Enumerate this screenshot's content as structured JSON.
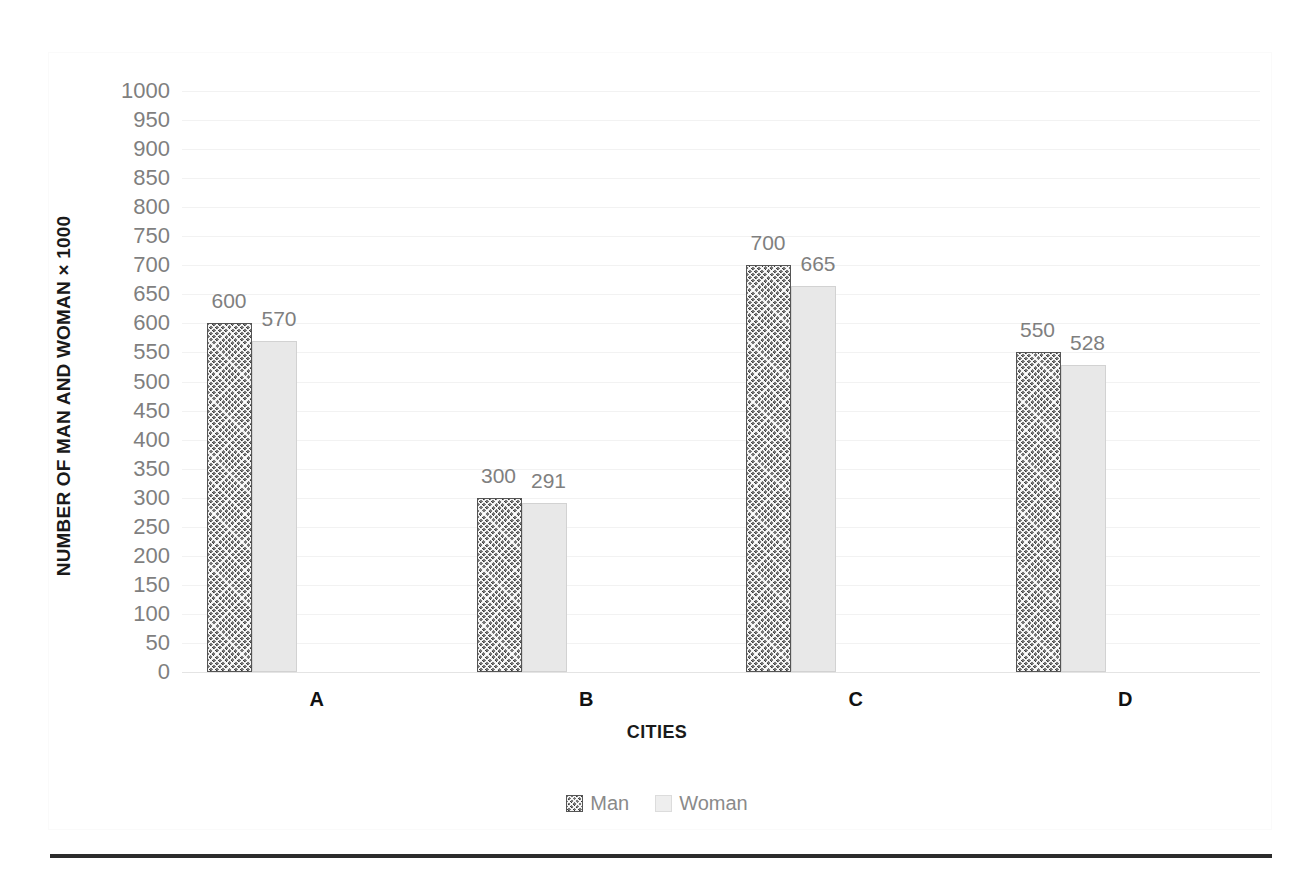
{
  "chart_data": {
    "type": "bar",
    "title": "",
    "xlabel": "CITIES",
    "ylabel": "NUMBER OF MAN AND WOMAN × 1000",
    "categories": [
      "A",
      "B",
      "C",
      "D"
    ],
    "series": [
      {
        "name": "Man",
        "values": [
          600,
          300,
          700,
          550
        ]
      },
      {
        "name": "Woman",
        "values": [
          570,
          291,
          665,
          528
        ]
      }
    ],
    "ylim": [
      0,
      1000
    ],
    "ytick_step": 50,
    "yticks": [
      1000,
      950,
      900,
      850,
      800,
      750,
      700,
      650,
      600,
      550,
      500,
      450,
      400,
      350,
      300,
      250,
      200,
      150,
      100,
      50,
      0
    ],
    "ytick_labels": [
      "1000",
      "950",
      "900",
      "850",
      "800",
      "750",
      "700",
      "650",
      "600",
      "550",
      "500",
      "450",
      "400",
      "350",
      "300",
      "250",
      "200",
      "150",
      "100",
      "50",
      "0"
    ],
    "data_labels": {
      "Man": [
        "600",
        "300",
        "700",
        "550"
      ],
      "Woman": [
        "570",
        "291",
        "665",
        "528"
      ]
    },
    "grid": true,
    "legend_position": "bottom",
    "colors": {
      "man_fill": "#6e6e6e",
      "man_pattern": "checkerboard",
      "woman_fill": "#e8e8e8",
      "gridline": "#f2f2f2",
      "tick_text": "#7f7f7f",
      "axis_title_text": "#1a1a1a",
      "rule": "#2b2b2b"
    }
  },
  "legend": {
    "items": [
      {
        "label": "Man",
        "swatch": "man-pattern-swatch"
      },
      {
        "label": "Woman",
        "swatch": "woman-solid-swatch"
      }
    ]
  }
}
